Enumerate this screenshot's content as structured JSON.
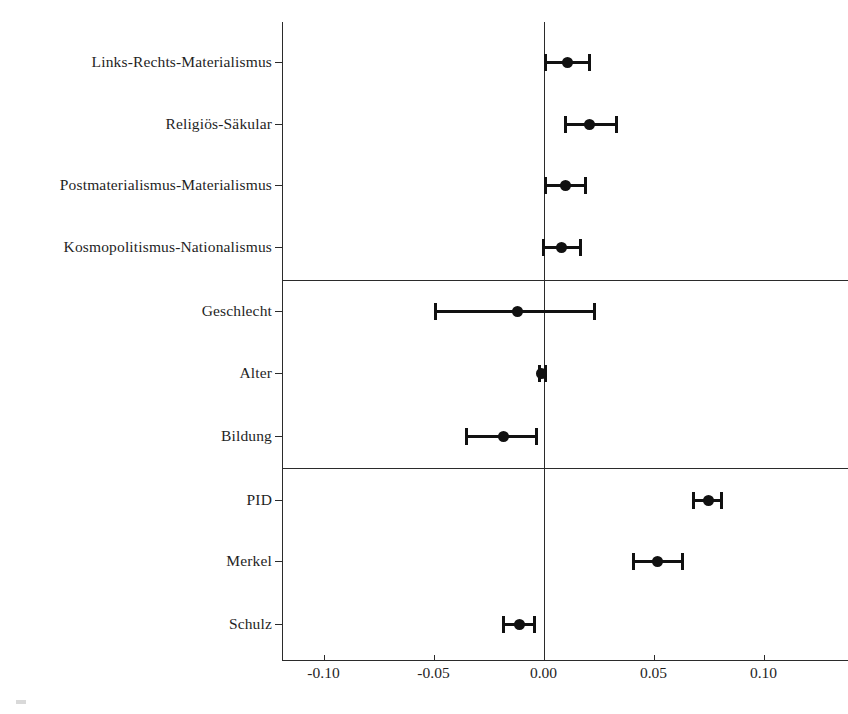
{
  "chart_data": {
    "type": "scatter",
    "title": "",
    "subtitle": "",
    "xlabel": "",
    "ylabel": "",
    "xlim": [
      -0.135,
      0.122
    ],
    "xticks": [
      -0.1,
      -0.05,
      0.0,
      0.05,
      0.1
    ],
    "xticklabels": [
      "-0.10",
      "-0.05",
      "0.00",
      "0.05",
      "0.10"
    ],
    "grid": false,
    "legend": "none",
    "reference_line": 0.0,
    "error_bar_style": "horizontal-capped-95ci",
    "marker": "filled-circle",
    "color": "#111111",
    "group_separators_after": [
      "Kosmopolitismus-Nationalismus",
      "Bildung"
    ],
    "categories": [
      "Links-Rechts-Materialismus",
      "Religiös-Säkular",
      "Postmaterialismus-Materialismus",
      "Kosmopolitismus-Nationalismus",
      "Geschlecht",
      "Alter",
      "Bildung",
      "PID",
      "Merkel",
      "Schulz"
    ],
    "points": [
      {
        "label": "Links-Rechts-Materialismus",
        "estimate": 0.011,
        "ci_low": 0.001,
        "ci_high": 0.021
      },
      {
        "label": "Religiös-Säkular",
        "estimate": 0.021,
        "ci_low": 0.01,
        "ci_high": 0.033
      },
      {
        "label": "Postmaterialismus-Materialismus",
        "estimate": 0.01,
        "ci_low": 0.001,
        "ci_high": 0.019
      },
      {
        "label": "Kosmopolitismus-Nationalismus",
        "estimate": 0.008,
        "ci_low": 0.0,
        "ci_high": 0.017
      },
      {
        "label": "Geschlecht",
        "estimate": -0.012,
        "ci_low": -0.049,
        "ci_high": 0.023
      },
      {
        "label": "Alter",
        "estimate": -0.001,
        "ci_low": -0.002,
        "ci_high": 0.001
      },
      {
        "label": "Bildung",
        "estimate": -0.018,
        "ci_low": -0.035,
        "ci_high": -0.003
      },
      {
        "label": "PID",
        "estimate": 0.075,
        "ci_low": 0.068,
        "ci_high": 0.081
      },
      {
        "label": "Merkel",
        "estimate": 0.052,
        "ci_low": 0.041,
        "ci_high": 0.063
      },
      {
        "label": "Schulz",
        "estimate": -0.011,
        "ci_low": -0.018,
        "ci_high": -0.004
      }
    ]
  },
  "axis": {
    "x_tick_labels": [
      "-0.10",
      "-0.05",
      "0.00",
      "0.05",
      "0.10"
    ],
    "y_tick_labels": [
      "Links-Rechts-Materialismus",
      "Religiös-Säkular",
      "Postmaterialismus-Materialismus",
      "Kosmopolitismus-Nationalismus",
      "Geschlecht",
      "Alter",
      "Bildung",
      "PID",
      "Merkel",
      "Schulz"
    ]
  }
}
